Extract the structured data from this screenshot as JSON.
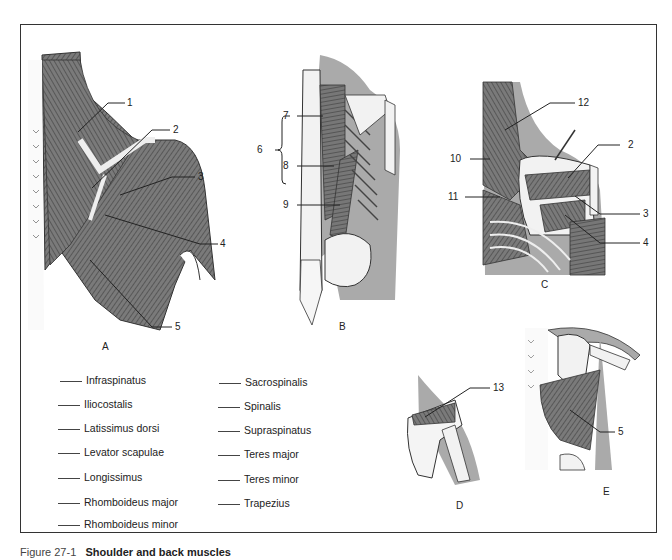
{
  "figure": {
    "caption_prefix": "Figure 27-1",
    "caption_title": "Shoulder and back muscles"
  },
  "panels": [
    {
      "id": "A",
      "label": "A"
    },
    {
      "id": "B",
      "label": "B"
    },
    {
      "id": "C",
      "label": "C"
    },
    {
      "id": "D",
      "label": "D"
    },
    {
      "id": "E",
      "label": "E"
    }
  ],
  "callouts": {
    "A": [
      "1",
      "2",
      "3",
      "4",
      "5"
    ],
    "B": [
      "6",
      "7",
      "8",
      "9"
    ],
    "C": [
      "12",
      "2",
      "10",
      "11",
      "3",
      "4"
    ],
    "D": [
      "13"
    ],
    "E": [
      "5"
    ]
  },
  "terms_left": [
    "Infraspinatus",
    "Iliocostalis",
    "Latissimus dorsi",
    "Levator scapulae",
    "Longissimus",
    "Rhomboideus major",
    "Rhomboideus minor"
  ],
  "terms_right": [
    "Sacrospinalis",
    "Spinalis",
    "Supraspinatus",
    "Teres major",
    "Teres minor",
    "Trapezius"
  ],
  "colors": {
    "muscle": "#6f6f6f",
    "skin": "#a9a9a9",
    "bone": "#f2f2f2",
    "ink": "#222222"
  }
}
